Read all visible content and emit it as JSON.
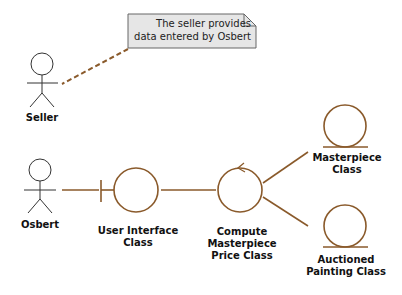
{
  "diagram": {
    "type": "UML communication/robustness diagram",
    "colors": {
      "link": "#8a5a2b",
      "class_outline": "#8a5a2b",
      "actor": "#333333",
      "note_fill": "#e6e6e6",
      "note_border": "#666666"
    },
    "note": {
      "text": "The seller provides\ndata entered by Osbert"
    },
    "actors": [
      {
        "id": "seller",
        "label": "Seller"
      },
      {
        "id": "osbert",
        "label": "Osbert"
      }
    ],
    "classes": [
      {
        "id": "ui",
        "stereotype": "boundary",
        "label": "User Interface\nClass"
      },
      {
        "id": "compute",
        "stereotype": "control",
        "label": "Compute\nMasterpiece\nPrice Class"
      },
      {
        "id": "masterpiece",
        "stereotype": "entity",
        "label": "Masterpiece\nClass"
      },
      {
        "id": "auctioned",
        "stereotype": "entity",
        "label": "Auctioned\nPainting Class"
      }
    ],
    "links": [
      {
        "from": "osbert",
        "to": "ui"
      },
      {
        "from": "ui",
        "to": "compute"
      },
      {
        "from": "compute",
        "to": "masterpiece"
      },
      {
        "from": "compute",
        "to": "auctioned"
      },
      {
        "from": "seller",
        "to": "note",
        "style": "dashed"
      }
    ]
  }
}
